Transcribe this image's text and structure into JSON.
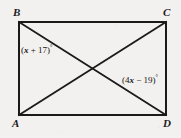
{
  "figure": {
    "background_color": "#f2f1ef",
    "stroke_color": "#1a1a1a",
    "stroke_width": 2,
    "shape": "rectangle-with-diagonals",
    "rectangle": {
      "left": 19,
      "top": 22,
      "right": 166,
      "bottom": 115
    },
    "diagonal_intersection": {
      "x": 93,
      "y": 68
    },
    "vertices": [
      {
        "id": "B",
        "label": "B",
        "corner": "top-left",
        "x": 19,
        "y": 22
      },
      {
        "id": "C",
        "label": "C",
        "corner": "top-right",
        "x": 166,
        "y": 22
      },
      {
        "id": "A",
        "label": "A",
        "corner": "bottom-left",
        "x": 19,
        "y": 115
      },
      {
        "id": "D",
        "label": "D",
        "corner": "bottom-right",
        "x": 166,
        "y": 115
      }
    ],
    "diagonals": [
      {
        "id": "BD",
        "from": "B",
        "to": "D"
      },
      {
        "id": "AC",
        "from": "A",
        "to": "C"
      }
    ],
    "angle_labels": [
      {
        "id": "angle-at-b",
        "expression_prefix": "(",
        "variable": "x",
        "operator": " + ",
        "constant": "17",
        "expression_suffix": ")",
        "degree_symbol": "°",
        "full_text": "(x + 17)°",
        "near_vertex": "B"
      },
      {
        "id": "angle-at-d",
        "expression_prefix": "(4",
        "variable": "x",
        "operator": " − ",
        "constant": "19",
        "expression_suffix": ")",
        "degree_symbol": "°",
        "full_text": "(4x − 19)°",
        "near_vertex": "D"
      }
    ]
  }
}
